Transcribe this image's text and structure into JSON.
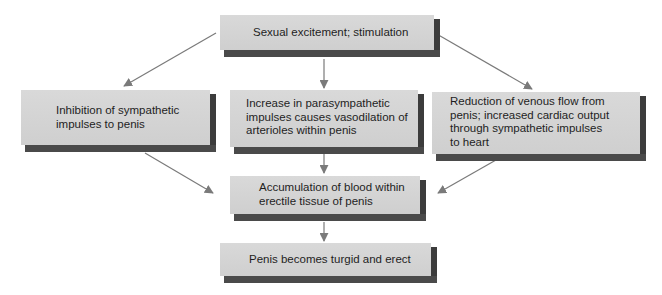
{
  "diagram": {
    "nodes": {
      "stimulus": {
        "label": "Sexual excitement; stimulation"
      },
      "inhibition": {
        "label": "Inhibition of sympathetic\nimpulses to penis"
      },
      "parasympathetic": {
        "label": "Increase in parasympathetic\nimpulses causes vasodilation of\narterioles within penis"
      },
      "venous": {
        "label": "Reduction of venous flow from\npenis; increased cardiac output\nthrough sympathetic impulses\nto heart"
      },
      "accumulation": {
        "label": "Accumulation of blood within\nerectile tissue of penis"
      },
      "erection": {
        "label": "Penis becomes turgid and erect"
      }
    },
    "edges": [
      {
        "from": "stimulus",
        "to": "inhibition"
      },
      {
        "from": "stimulus",
        "to": "parasympathetic"
      },
      {
        "from": "stimulus",
        "to": "venous"
      },
      {
        "from": "inhibition",
        "to": "accumulation"
      },
      {
        "from": "parasympathetic",
        "to": "accumulation"
      },
      {
        "from": "venous",
        "to": "accumulation"
      },
      {
        "from": "accumulation",
        "to": "erection"
      }
    ],
    "colors": {
      "box_face": "#d4d4d4",
      "box_shadow": "#444444",
      "arrow": "#7a7a7a",
      "text": "#1e1e1e"
    }
  }
}
